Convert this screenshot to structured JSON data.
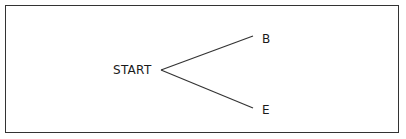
{
  "diagram": {
    "type": "tree",
    "nodes": [
      {
        "id": "start",
        "label": "START"
      },
      {
        "id": "b",
        "label": "B"
      },
      {
        "id": "e",
        "label": "E"
      }
    ],
    "edges": [
      {
        "from": "start",
        "to": "b"
      },
      {
        "from": "start",
        "to": "e"
      }
    ],
    "colors": {
      "line": "#333333",
      "text": "#1a1a1a",
      "background": "#ffffff"
    }
  }
}
